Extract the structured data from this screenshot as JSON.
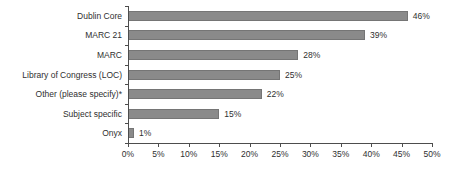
{
  "chart_data": {
    "type": "bar",
    "orientation": "horizontal",
    "title": "",
    "xlabel": "",
    "ylabel": "",
    "categories": [
      "Dublin Core",
      "MARC 21",
      "MARC",
      "Library of Congress (LOC)",
      "Other (please specify)*",
      "Subject specific",
      "Onyx"
    ],
    "values": [
      46,
      39,
      28,
      25,
      22,
      15,
      1
    ],
    "value_labels": [
      "46%",
      "39%",
      "28%",
      "25%",
      "22%",
      "15%",
      "1%"
    ],
    "x_ticks": [
      "0%",
      "5%",
      "10%",
      "15%",
      "20%",
      "25%",
      "30%",
      "35%",
      "40%",
      "45%",
      "50%"
    ],
    "x_tick_values": [
      0,
      5,
      10,
      15,
      20,
      25,
      30,
      35,
      40,
      45,
      50
    ],
    "xlim": [
      0,
      50
    ],
    "grid": false,
    "legend": false,
    "colors": {
      "bar_fill": "#8a8a8a",
      "bar_edge": "#757575",
      "axis": "#4d4d4d",
      "text": "#2f2f2f",
      "background": "#ffffff"
    }
  }
}
